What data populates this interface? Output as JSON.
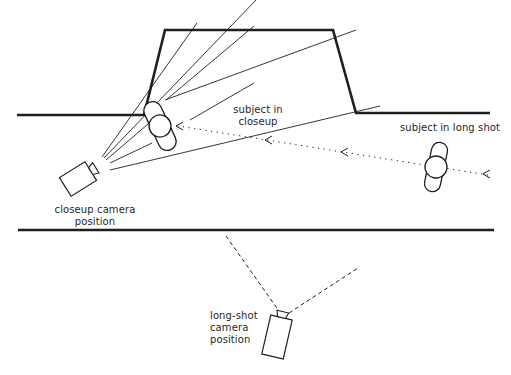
{
  "diagram": {
    "labels": {
      "subject_closeup": [
        "subject in",
        "closeup"
      ],
      "subject_longshot": "subject in long shot",
      "closeup_camera": [
        "closeup camera",
        "position"
      ],
      "longshot_camera": [
        "long-shot",
        "camera",
        "position"
      ]
    },
    "colors": {
      "ink": "#1f1f1f",
      "background": "#ffffff"
    }
  }
}
